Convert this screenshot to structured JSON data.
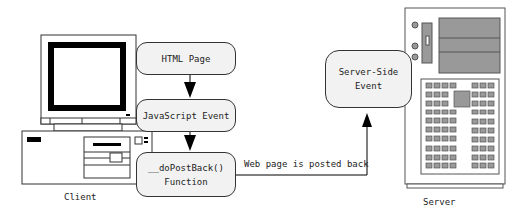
{
  "diagram": {
    "client_label": "Client",
    "server_label": "Server",
    "nodes": {
      "html_page": "HTML Page",
      "js_event": "JavaScript Event",
      "dopostback_line1": "__doPostBack()",
      "dopostback_line2": "Function",
      "server_event_line1": "Server-Side",
      "server_event_line2": "Event"
    },
    "edge_label": "Web page is posted back",
    "colors": {
      "node_fill": "#f2f2f2",
      "stroke": "#333333",
      "server_gray": "#9a9a9a"
    }
  }
}
